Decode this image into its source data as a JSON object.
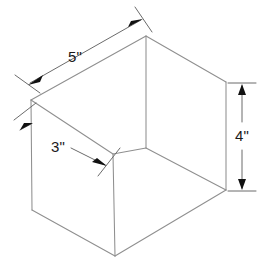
{
  "figure": {
    "type": "technical-line-drawing",
    "background_color": "#ffffff",
    "edge_color": "#8f8f8f",
    "dimension_line_color": "#6b6b6b",
    "arrow_color": "#111111",
    "text_color": "#1a1a1a"
  },
  "dimensions": [
    {
      "id": "length",
      "label": "5\"",
      "value": 5,
      "unit": "inches",
      "edge": "top-back-left-to-apex",
      "label_x": 84,
      "label_y": 57
    },
    {
      "id": "depth",
      "label": "3\"",
      "value": 3,
      "unit": "inches",
      "edge": "top-left-to-inner-corner",
      "label_x": 58,
      "label_y": 149
    },
    {
      "id": "height",
      "label": "4\"",
      "value": 4,
      "unit": "inches",
      "edge": "right-vertical",
      "label_x": 236,
      "label_y": 142
    }
  ],
  "geometry": {
    "vertices": {
      "apex_top": [
        146,
        36
      ],
      "back_left_top": [
        31,
        100
      ],
      "right_top": [
        226,
        82
      ],
      "inner_corner": [
        113,
        154
      ],
      "mid_bottom_center": [
        146,
        148
      ],
      "left_bottom": [
        32,
        210
      ],
      "right_bottom": [
        226,
        190
      ],
      "front_bottom": [
        115,
        256
      ]
    }
  }
}
